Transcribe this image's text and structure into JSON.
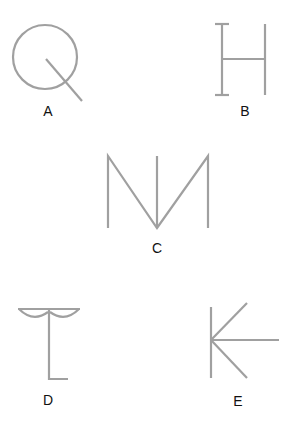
{
  "figures": [
    {
      "label": "A",
      "description": "circle with diagonal line from center extending outward (Q-like)"
    },
    {
      "label": "B",
      "description": "H shape with serifs on left vertical"
    },
    {
      "label": "C",
      "description": "M shape with middle vertical line"
    },
    {
      "label": "D",
      "description": "vertical with top bar and two arcs, foot to right"
    },
    {
      "label": "E",
      "description": "vertical with three rays from midpoint (K with horizontal)"
    }
  ],
  "colors": {
    "stroke": "#a0a0a0",
    "label": "#111111"
  }
}
